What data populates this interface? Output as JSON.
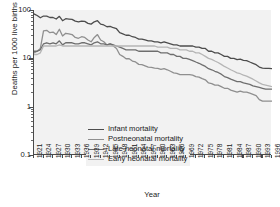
{
  "chart_data": {
    "type": "line",
    "title": "",
    "xlabel": "Year",
    "ylabel": "Deaths per 1000 live births",
    "yscale": "log",
    "ylim": [
      0.1,
      100
    ],
    "ytick_labels": [
      "100",
      "10",
      "1",
      "0.1"
    ],
    "ytick_values": [
      100,
      10,
      1,
      0.1
    ],
    "xlim": [
      1921,
      1996
    ],
    "grid": false,
    "legend_position": "lower-left-inside",
    "xtick_labels": [
      "1921",
      "1924",
      "1927",
      "1930",
      "1933",
      "1936",
      "1939",
      "1942",
      "1945",
      "1948",
      "1951",
      "1954",
      "1957",
      "1960",
      "1963",
      "1966",
      "1969",
      "1972",
      "1975",
      "1978",
      "1981",
      "1984",
      "1987",
      "1990",
      "1993",
      "1996"
    ],
    "x": [
      1921,
      1922,
      1923,
      1924,
      1925,
      1926,
      1927,
      1928,
      1929,
      1930,
      1931,
      1932,
      1933,
      1934,
      1935,
      1936,
      1937,
      1938,
      1939,
      1940,
      1941,
      1942,
      1943,
      1944,
      1945,
      1946,
      1947,
      1948,
      1949,
      1950,
      1951,
      1952,
      1953,
      1954,
      1955,
      1956,
      1957,
      1958,
      1959,
      1960,
      1961,
      1962,
      1963,
      1964,
      1965,
      1966,
      1967,
      1968,
      1969,
      1970,
      1971,
      1972,
      1973,
      1974,
      1975,
      1976,
      1977,
      1978,
      1979,
      1980,
      1981,
      1982,
      1983,
      1984,
      1985,
      1986,
      1987,
      1988,
      1989,
      1990,
      1991,
      1992,
      1993,
      1994,
      1995,
      1996
    ],
    "series": [
      {
        "name": "Infant mortality",
        "color": "#4d4d4d",
        "width": 1.3,
        "values": [
          83,
          77,
          69,
          75,
          75,
          70,
          70,
          65,
          74,
          60,
          66,
          65,
          64,
          59,
          57,
          59,
          58,
          53,
          51,
          57,
          60,
          51,
          49,
          45,
          46,
          43,
          41,
          34,
          32,
          30,
          30,
          28,
          27,
          25,
          25,
          24,
          23,
          23,
          22,
          22,
          21,
          22,
          21,
          20,
          19,
          19,
          18,
          18,
          18,
          18,
          18,
          17,
          17,
          16,
          16,
          14,
          14,
          13,
          13,
          12,
          11,
          11,
          10,
          10,
          9.4,
          9.6,
          9.1,
          9,
          8.4,
          7.9,
          7.4,
          6.6,
          6.3,
          6.2,
          6.2,
          6.1
        ]
      },
      {
        "name": "Postneonatal mortality",
        "color": "#8f8f8f",
        "width": 1.3,
        "values": [
          13,
          14,
          16,
          37,
          38,
          34,
          35,
          31,
          40,
          29,
          33,
          32,
          31,
          27,
          26,
          28,
          27,
          24,
          22,
          27,
          31,
          24,
          22,
          19,
          20,
          18,
          16,
          12,
          11,
          9.8,
          9.8,
          8.8,
          8.4,
          7.5,
          7.4,
          7,
          6.6,
          6.5,
          6.3,
          6.2,
          5.9,
          6.1,
          5.8,
          5.4,
          5,
          4.9,
          4.6,
          4.6,
          4.6,
          4.6,
          4.5,
          4.2,
          4.1,
          3.8,
          3.6,
          3.1,
          3,
          2.8,
          2.8,
          2.6,
          2.4,
          2.4,
          2.2,
          2.1,
          2,
          2.1,
          2,
          2,
          1.9,
          1.8,
          1.7,
          1.4,
          1.3,
          1.3,
          1.3,
          1.3
        ]
      },
      {
        "name": "Late neonatal mortality",
        "color": "#6e6e6e",
        "width": 1.3,
        "values": [
          14,
          14,
          15,
          20,
          21,
          20,
          21,
          20,
          23,
          19,
          21,
          21,
          21,
          20,
          20,
          21,
          21,
          20,
          19,
          21,
          22,
          20,
          20,
          19,
          20,
          19,
          18,
          17,
          16,
          15,
          15,
          15,
          15,
          14,
          14,
          14,
          14,
          14,
          14,
          14,
          13,
          13,
          13,
          12,
          12,
          11,
          11,
          10,
          10,
          9.5,
          9,
          8.4,
          7.9,
          7.3,
          6.8,
          6.1,
          5.8,
          5.4,
          5.1,
          4.7,
          4.2,
          4,
          3.7,
          3.5,
          3.3,
          3.3,
          3.1,
          3,
          2.9,
          2.7,
          2.6,
          2.5,
          2.4,
          2.3,
          2.3,
          2.3
        ]
      },
      {
        "name": "Early neonatal mortality",
        "color": "#b5b5b5",
        "width": 1.3,
        "values": [
          12,
          12,
          13,
          18,
          18,
          18,
          18,
          18,
          19,
          18,
          18,
          18,
          18,
          18,
          18,
          18,
          18,
          18,
          18,
          18,
          18,
          18,
          18,
          18,
          18,
          18,
          18,
          18,
          18,
          18,
          18,
          18,
          18,
          18,
          18,
          18,
          18,
          18,
          18,
          17,
          17,
          17,
          17,
          16,
          16,
          16,
          15,
          15,
          15,
          14,
          14,
          13,
          13,
          12,
          11,
          10,
          9.5,
          8.8,
          8.2,
          7.5,
          6.8,
          6.3,
          5.8,
          5.4,
          5,
          4.8,
          4.5,
          4.3,
          4,
          3.7,
          3.4,
          3.1,
          2.9,
          2.8,
          2.7,
          2.6
        ]
      }
    ]
  }
}
